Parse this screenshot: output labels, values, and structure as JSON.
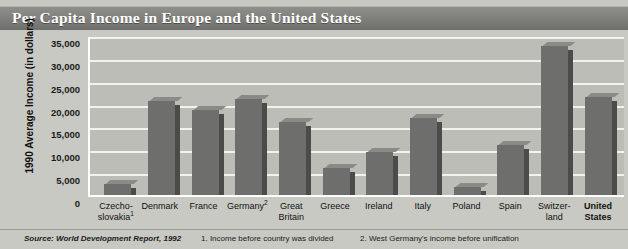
{
  "title": "Per Capita Income in Europe and the United States",
  "footer": {
    "source": "Source: World Development Report, 1992",
    "note1": "1. Income before country was divided",
    "note2": "2. West Germany's income before unification"
  },
  "colors": {
    "banner": "#7e7e7a",
    "page_background": "#c9c9c4",
    "plot_background": "#bdbdb8",
    "gridline": "#f2f2ee",
    "bar_front": "#6e6e6c",
    "bar_side": "#4b4b49",
    "bar_top": "#8a8a87",
    "title_text": "#ffffff"
  },
  "chart_data": {
    "type": "bar",
    "title": "Per Capita Income in Europe and the United States",
    "xlabel": "",
    "ylabel": "1990 Average Income (in dollars)",
    "ylim": [
      0,
      35000
    ],
    "ytick_step": 5000,
    "grid": true,
    "legend": "none",
    "ytick_labels": [
      "35,000",
      "30,000",
      "25,000",
      "20,000",
      "15,000",
      "10,000",
      "5,000",
      "0"
    ],
    "ytick_values": [
      35000,
      30000,
      25000,
      20000,
      15000,
      10000,
      5000,
      0
    ],
    "categories": [
      "Czecho-slovakia",
      "Denmark",
      "France",
      "Germany",
      "Great Britain",
      "Greece",
      "Ireland",
      "Italy",
      "Poland",
      "Spain",
      "Switzer-land",
      "United States"
    ],
    "category_labels": [
      {
        "line1": "Czecho-",
        "line2": "slovakia",
        "footnote": "1",
        "bold": false
      },
      {
        "line1": "Denmark",
        "line2": "",
        "footnote": "",
        "bold": false
      },
      {
        "line1": "France",
        "line2": "",
        "footnote": "",
        "bold": false
      },
      {
        "line1": "Germany",
        "line2": "",
        "footnote": "2",
        "bold": false
      },
      {
        "line1": "Great",
        "line2": "Britain",
        "footnote": "",
        "bold": false
      },
      {
        "line1": "Greece",
        "line2": "",
        "footnote": "",
        "bold": false
      },
      {
        "line1": "Ireland",
        "line2": "",
        "footnote": "",
        "bold": false
      },
      {
        "line1": "Italy",
        "line2": "",
        "footnote": "",
        "bold": false
      },
      {
        "line1": "Poland",
        "line2": "",
        "footnote": "",
        "bold": false
      },
      {
        "line1": "Spain",
        "line2": "",
        "footnote": "",
        "bold": false
      },
      {
        "line1": "Switzer-",
        "line2": "land",
        "footnote": "",
        "bold": false
      },
      {
        "line1": "United",
        "line2": "States",
        "footnote": "",
        "bold": true
      }
    ],
    "values": [
      2500,
      20500,
      18500,
      21000,
      16000,
      6000,
      9500,
      16800,
      1700,
      11000,
      32500,
      21500
    ]
  }
}
